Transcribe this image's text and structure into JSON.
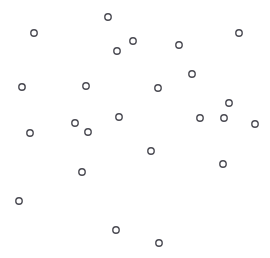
{
  "page": {
    "background_color": "#ffffff",
    "width": 270,
    "height": 258
  },
  "chart_data": {
    "type": "scatter",
    "title": "",
    "subtitle": "",
    "xlabel": "",
    "ylabel": "",
    "xlim": [
      0,
      270
    ],
    "ylim": [
      0,
      258
    ],
    "grid": false,
    "axes_visible": false,
    "tick_labels_x": [],
    "tick_labels_y": [],
    "legend": {
      "visible": false,
      "position": "none",
      "entries": []
    },
    "annotations": [],
    "marker": {
      "shape": "circle-open",
      "radius": 3.2,
      "stroke_width": 1.4,
      "stroke_color": "#4a4a52",
      "fill_color": "none"
    },
    "point_count": 27,
    "series": [
      {
        "name": "points",
        "marker_shape": "circle-open",
        "marker_color": "#4a4a52",
        "points": [
          {
            "x": 108,
            "y": 17
          },
          {
            "x": 34,
            "y": 33
          },
          {
            "x": 239,
            "y": 33
          },
          {
            "x": 133,
            "y": 41
          },
          {
            "x": 179,
            "y": 45
          },
          {
            "x": 117,
            "y": 51
          },
          {
            "x": 192,
            "y": 74
          },
          {
            "x": 22,
            "y": 87
          },
          {
            "x": 86,
            "y": 86
          },
          {
            "x": 158,
            "y": 88
          },
          {
            "x": 229,
            "y": 103
          },
          {
            "x": 119,
            "y": 117
          },
          {
            "x": 200,
            "y": 118
          },
          {
            "x": 224,
            "y": 118
          },
          {
            "x": 255,
            "y": 124
          },
          {
            "x": 75,
            "y": 123
          },
          {
            "x": 30,
            "y": 133
          },
          {
            "x": 88,
            "y": 132
          },
          {
            "x": 151,
            "y": 151
          },
          {
            "x": 223,
            "y": 164
          },
          {
            "x": 82,
            "y": 172
          },
          {
            "x": 19,
            "y": 201
          },
          {
            "x": 116,
            "y": 230
          },
          {
            "x": 159,
            "y": 243
          }
        ]
      }
    ]
  }
}
